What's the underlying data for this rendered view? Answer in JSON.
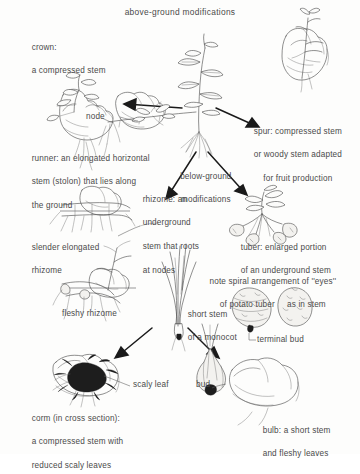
{
  "figure": {
    "title": "above-ground modifications",
    "subtitle": "below-ground modifications",
    "type": "botanical-diagram"
  },
  "labels": {
    "crown_line1": "crown:",
    "crown_line2": "a compressed stem",
    "node": "node",
    "spur_line1": "spur: compressed stem",
    "spur_line2": "or woody stem adapted",
    "spur_line3": "for fruit production",
    "runner_line1": "runner: an elongated horizontal",
    "runner_line2": "stem (stolon) that lies along",
    "runner_line3": "the ground",
    "below_line1": "below-ground",
    "below_line2": "modifications",
    "rhizome_line1": "rhizome: an",
    "rhizome_line2": "underground",
    "rhizome_line3": "stem that roots",
    "rhizome_line4": "at nodes",
    "slender_line1": "slender elongated",
    "slender_line2": "rhizome",
    "tuber_line1": "tuber: enlarged portion",
    "tuber_line2": "of an underground stem",
    "eyes_line1": "note spiral arrangement of ''eyes''",
    "eyes_line2": "of potato tuber     as in stem",
    "fleshy_rhizome": "fleshy rhizome",
    "monocot_line1": "short stem",
    "monocot_line2": "of a monocot",
    "terminal_bud": "terminal bud",
    "scaly_leaf": "scaly leaf",
    "bud": "bud",
    "corm_line1": "corm (in cross section):",
    "corm_line2": "a compressed stem with",
    "corm_line3": "reduced scaly leaves",
    "bulb_line1": "bulb: a short stem",
    "bulb_line2": "and fleshy leaves"
  },
  "illustrations": [
    {
      "name": "crown-plant-in-hand",
      "caption_ref": "crown"
    },
    {
      "name": "runner-stolon-in-hand",
      "caption_ref": "runner"
    },
    {
      "name": "central-whole-plant",
      "caption_ref": "center"
    },
    {
      "name": "spur-twig-in-hand",
      "caption_ref": "spur"
    },
    {
      "name": "rhizome-in-soil",
      "caption_ref": "rhizome"
    },
    {
      "name": "potato-tuber-plant",
      "caption_ref": "tuber"
    },
    {
      "name": "fleshy-rhizome-in-soil",
      "caption_ref": "fleshy rhizome"
    },
    {
      "name": "monocot-short-stem",
      "caption_ref": "monocot"
    },
    {
      "name": "potato-tuber-pair",
      "caption_ref": "eyes"
    },
    {
      "name": "corm-cross-section-in-hand",
      "caption_ref": "corm"
    },
    {
      "name": "bulb-in-hand",
      "caption_ref": "bulb"
    }
  ],
  "colors": {
    "ink": "#4b4b4b",
    "arrow": "#1a1a1a",
    "text": "#4a4a4a",
    "background": "#fdfdfc"
  }
}
